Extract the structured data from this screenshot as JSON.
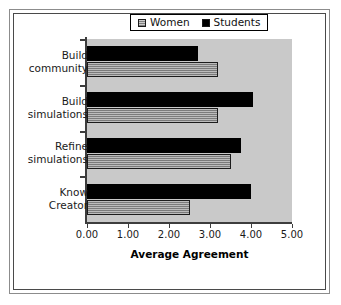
{
  "chart_data": {
    "type": "bar",
    "orientation": "horizontal",
    "title": "",
    "xlabel": "Average Agreement",
    "ylabel": "",
    "xlim": [
      0,
      5
    ],
    "xticks": [
      "0.00",
      "1.00",
      "2.00",
      "3.00",
      "4.00",
      "5.00"
    ],
    "xtick_values": [
      0,
      1,
      2,
      3,
      4,
      5
    ],
    "grid": false,
    "legend_position": "top-center",
    "categories": [
      "Build community",
      "Build simulations",
      "Refine simulations",
      "Know Creator"
    ],
    "category_lines": [
      [
        "Build",
        "community"
      ],
      [
        "Build",
        "simulations"
      ],
      [
        "Refine",
        "simulations"
      ],
      [
        "Know",
        "Creator"
      ]
    ],
    "series": [
      {
        "name": "Women",
        "color": "#8c8c8c",
        "values": [
          3.2,
          3.2,
          3.5,
          2.5
        ]
      },
      {
        "name": "Students",
        "color": "#000000",
        "values": [
          2.7,
          4.05,
          3.75,
          4.0
        ]
      }
    ]
  },
  "legend": {
    "entries": [
      {
        "label": "Women",
        "swatch": "gray-hatch-swatch"
      },
      {
        "label": "Students",
        "swatch": "black-swatch"
      }
    ]
  },
  "colors": {
    "plot_background": "#c9c9c9",
    "students_bar": "#000000",
    "women_bar": "#8c8c8c",
    "axis": "#3d3d3d",
    "frame_outer": "#8c8c8c",
    "frame_inner": "#4a4a4a"
  }
}
